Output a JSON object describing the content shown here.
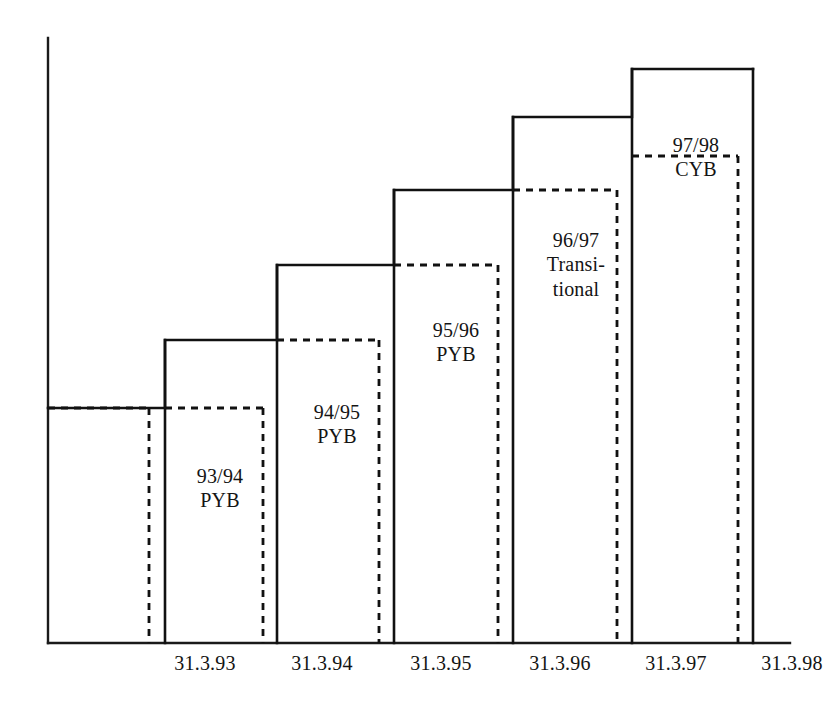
{
  "chart_data": {
    "type": "bar",
    "title": "",
    "subtitle": "",
    "xlabel": "",
    "ylabel": "",
    "grid": false,
    "legend_position": "none",
    "categories": [
      "31.3.93",
      "31.3.94",
      "31.3.95",
      "31.3.96",
      "31.3.97",
      "31.3.98"
    ],
    "x_tick_labels": [
      "31.3.93",
      "31.3.94",
      "31.3.95",
      "31.3.96",
      "31.3.97",
      "31.3.98"
    ],
    "series": [
      {
        "name": "Solid outline (actual period)",
        "style": "solid",
        "values": [
          1,
          2,
          3,
          4,
          5,
          6
        ]
      },
      {
        "name": "Dashed outline (offset period)",
        "style": "dashed",
        "values": [
          1,
          2,
          3,
          4,
          5,
          6
        ]
      }
    ],
    "steps": [
      {
        "index": 0,
        "label": "",
        "label_lines": [],
        "solid_top_y": 408,
        "dashed_top_y": 408,
        "solid_left_x": 48,
        "solid_right_x": 165,
        "dashed_right_x": 149
      },
      {
        "index": 1,
        "label": "93/94 PYB",
        "label_lines": [
          "93/94",
          "PYB"
        ],
        "solid_top_y": 340,
        "dashed_top_y": 408,
        "solid_left_x": 165,
        "solid_right_x": 277,
        "dashed_right_x": 263
      },
      {
        "index": 2,
        "label": "94/95 PYB",
        "label_lines": [
          "94/95",
          "PYB"
        ],
        "solid_top_y": 265,
        "dashed_top_y": 340,
        "solid_left_x": 277,
        "solid_right_x": 394,
        "dashed_right_x": 379
      },
      {
        "index": 3,
        "label": "95/96 PYB",
        "label_lines": [
          "95/96",
          "PYB"
        ],
        "solid_top_y": 190,
        "dashed_top_y": 265,
        "solid_left_x": 394,
        "solid_right_x": 513,
        "dashed_right_x": 498
      },
      {
        "index": 4,
        "label": "96/97 Transitional",
        "label_lines": [
          "96/97",
          "Transi-",
          "tional"
        ],
        "solid_top_y": 117,
        "dashed_top_y": 190,
        "solid_left_x": 513,
        "solid_right_x": 632,
        "dashed_right_x": 617
      },
      {
        "index": 5,
        "label": "97/98 CYB",
        "label_lines": [
          "97/98",
          "CYB"
        ],
        "solid_top_y": 69,
        "dashed_top_y": 156,
        "solid_left_x": 632,
        "solid_right_x": 753,
        "dashed_right_x": 738
      }
    ],
    "bar_labels": [
      {
        "id": "label-93-94",
        "text": "93/94\nPYB",
        "x": 160,
        "y": 464,
        "width": 120
      },
      {
        "id": "label-94-95",
        "text": "94/95\nPYB",
        "x": 277,
        "y": 400,
        "width": 120
      },
      {
        "id": "label-95-96",
        "text": "95/96\nPYB",
        "x": 396,
        "y": 318,
        "width": 120
      },
      {
        "id": "label-96-97",
        "text": "96/97\nTransi-\ntional",
        "x": 516,
        "y": 228,
        "width": 120
      },
      {
        "id": "label-97-98",
        "text": "97/98\nCYB",
        "x": 636,
        "y": 133,
        "width": 120
      }
    ],
    "tick_positions": [
      {
        "label": "31.3.93",
        "x": 205,
        "y": 652
      },
      {
        "label": "31.3.94",
        "x": 322,
        "y": 652
      },
      {
        "label": "31.3.95",
        "x": 441,
        "y": 652
      },
      {
        "label": "31.3.96",
        "x": 560,
        "y": 652
      },
      {
        "label": "31.3.97",
        "x": 676,
        "y": 652
      },
      {
        "label": "31.3.98",
        "x": 792,
        "y": 652
      }
    ],
    "axes": {
      "y_axis_x": 48,
      "y_axis_top_y": 38,
      "baseline_y": 643,
      "baseline_right_x": 790
    },
    "colors": {
      "line": "#111111",
      "text": "#141414",
      "background": "#ffffff"
    }
  }
}
